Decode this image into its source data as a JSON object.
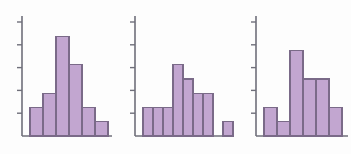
{
  "figure": {
    "title": "",
    "panel_count": 3,
    "background_color": "#fdfdfd",
    "bar_fill_color": "#c2a6d0",
    "bar_edge_color": "#7a6a88",
    "axis_color": "#6f6f7a"
  },
  "chart_data": [
    {
      "type": "bar",
      "title": "",
      "xlabel": "",
      "ylabel": "",
      "categories": [
        "1",
        "2",
        "3",
        "4",
        "5",
        "6"
      ],
      "values": [
        2,
        3,
        7,
        5,
        2,
        1
      ],
      "ylim": [
        0,
        8
      ],
      "xlim": [
        0,
        7
      ],
      "yticks": [
        1.6,
        3.2,
        4.8,
        6.4,
        8.0
      ],
      "ytick_labels": [
        "",
        "",
        "",
        "",
        ""
      ],
      "grid": false,
      "legend": false,
      "shape": "unimodal-symmetric",
      "gaps_after_bar_index": []
    },
    {
      "type": "bar",
      "title": "",
      "xlabel": "",
      "ylabel": "",
      "categories": [
        "1",
        "2",
        "3",
        "4",
        "5",
        "6",
        "7",
        "8",
        "9"
      ],
      "values": [
        2,
        2,
        2,
        5,
        4,
        3,
        3,
        0,
        1
      ],
      "ylim": [
        0,
        8
      ],
      "xlim": [
        0,
        10
      ],
      "yticks": [
        1.6,
        3.2,
        4.8,
        6.4,
        8.0
      ],
      "ytick_labels": [
        "",
        "",
        "",
        "",
        ""
      ],
      "grid": false,
      "legend": false,
      "shape": "right-skewed-with-outlier",
      "gaps_after_bar_index": [
        6
      ]
    },
    {
      "type": "bar",
      "title": "",
      "xlabel": "",
      "ylabel": "",
      "categories": [
        "1",
        "2",
        "3",
        "4",
        "5",
        "6"
      ],
      "values": [
        2,
        1,
        6,
        4,
        4,
        2
      ],
      "ylim": [
        0,
        8
      ],
      "xlim": [
        0,
        7
      ],
      "yticks": [
        1.6,
        3.2,
        4.8,
        6.4,
        8.0
      ],
      "ytick_labels": [
        "",
        "",
        "",
        "",
        ""
      ],
      "grid": false,
      "legend": false,
      "shape": "irregular-bimodal",
      "gaps_after_bar_index": []
    }
  ]
}
